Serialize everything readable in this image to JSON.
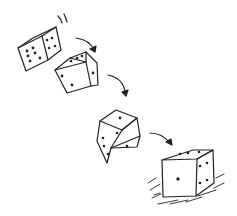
{
  "illustration": {
    "subject": "Hand-drawn sketch of dice rolling",
    "style": "pencil sketch, black lines on white",
    "stroke_color": "#222222",
    "background_color": "#ffffff",
    "dice": [
      {
        "position": "top-left",
        "faces_visible": [
          "six",
          "four"
        ],
        "state": "tumbling"
      },
      {
        "position": "upper-middle",
        "faces_visible": [
          "three",
          "two"
        ],
        "state": "tumbling"
      },
      {
        "position": "middle",
        "faces_visible": [
          "two",
          "three"
        ],
        "state": "bouncing"
      },
      {
        "position": "bottom-right",
        "faces_visible": [
          "one",
          "three",
          "four"
        ],
        "state": "landed"
      }
    ],
    "arrows": 3,
    "motion_marks": [
      "top-left speed lines",
      "ground scribble under landed die"
    ]
  }
}
